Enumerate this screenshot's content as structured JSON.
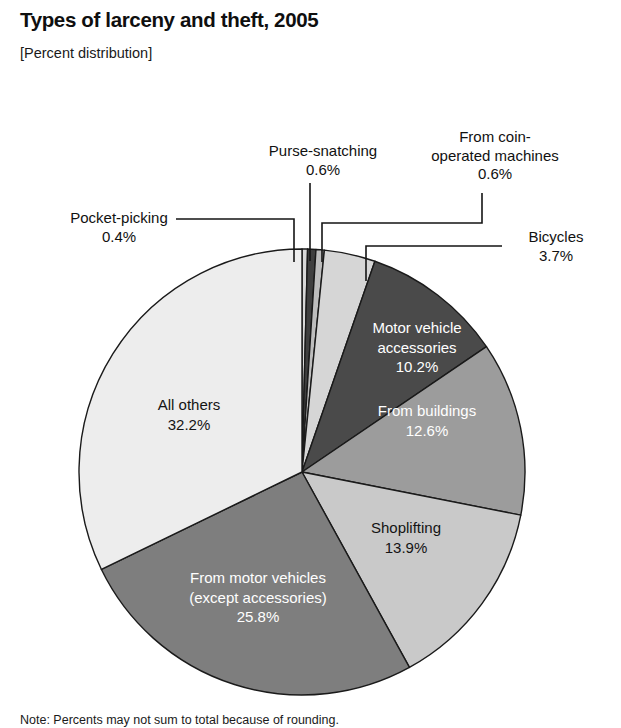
{
  "header": {
    "title": "Types of larceny and theft, 2005",
    "subtitle": "[Percent distribution]"
  },
  "note": {
    "text": "Note: Percents may not sum to total because of rounding."
  },
  "callouts": {
    "purse_snatching": {
      "name": "Purse-snatching",
      "value": "0.6%"
    },
    "coin_operated": {
      "name": "From coin-\noperated machines",
      "line1": "From coin-",
      "line2": "operated machines",
      "value": "0.6%"
    },
    "pocket_picking": {
      "name": "Pocket-picking",
      "value": "0.4%"
    },
    "bicycles": {
      "name": "Bicycles",
      "value": "3.7%"
    }
  },
  "slice_labels": {
    "motor_vehicle_accessories": {
      "line1": "Motor vehicle",
      "line2": "accessories",
      "value": "10.2%"
    },
    "from_buildings": {
      "line1": "From buildings",
      "value": "12.6%"
    },
    "shoplifting": {
      "line1": "Shoplifting",
      "value": "13.9%"
    },
    "from_motor_vehicles": {
      "line1": "From motor vehicles",
      "line2": "(except accessories)",
      "value": "25.8%"
    },
    "all_others": {
      "line1": "All others",
      "value": "32.2%"
    }
  },
  "chart_data": {
    "type": "pie",
    "title": "Types of larceny and theft, 2005",
    "subtitle": "[Percent distribution]",
    "unit": "percent",
    "total": 100.0,
    "legend_position": "labels-on-slices-and-callouts",
    "start_angle_deg": -90,
    "direction": "clockwise",
    "center": {
      "x": 302,
      "y": 472
    },
    "radius": 223,
    "categories": [
      "Pocket-picking",
      "Purse-snatching",
      "From coin-operated machines",
      "Bicycles",
      "Motor vehicle accessories",
      "From buildings",
      "Shoplifting",
      "From motor vehicles (except accessories)",
      "All others"
    ],
    "values": [
      0.4,
      0.6,
      0.6,
      3.7,
      10.2,
      12.6,
      13.9,
      25.8,
      32.2
    ],
    "labels": [
      "0.4%",
      "0.6%",
      "0.6%",
      "3.7%",
      "10.2%",
      "12.6%",
      "13.9%",
      "25.8%",
      "32.2%"
    ],
    "colors": [
      "#d8d8d8",
      "#3f3f3f",
      "#bdbdbd",
      "#d6d6d6",
      "#4a4a4a",
      "#9c9c9c",
      "#c9c9c9",
      "#7e7e7e",
      "#ededed"
    ],
    "slices": [
      {
        "name": "Pocket-picking",
        "value": 0.4,
        "label": "0.4%",
        "color": "#d8d8d8",
        "label_placement": "callout"
      },
      {
        "name": "Purse-snatching",
        "value": 0.6,
        "label": "0.6%",
        "color": "#3f3f3f",
        "label_placement": "callout"
      },
      {
        "name": "From coin-operated machines",
        "value": 0.6,
        "label": "0.6%",
        "color": "#bdbdbd",
        "label_placement": "callout"
      },
      {
        "name": "Bicycles",
        "value": 3.7,
        "label": "3.7%",
        "color": "#d6d6d6",
        "label_placement": "callout"
      },
      {
        "name": "Motor vehicle accessories",
        "value": 10.2,
        "label": "10.2%",
        "color": "#4a4a4a",
        "label_placement": "inside",
        "text_color": "#ffffff"
      },
      {
        "name": "From buildings",
        "value": 12.6,
        "label": "12.6%",
        "color": "#9c9c9c",
        "label_placement": "inside",
        "text_color": "#ffffff"
      },
      {
        "name": "Shoplifting",
        "value": 13.9,
        "label": "13.9%",
        "color": "#c9c9c9",
        "label_placement": "inside",
        "text_color": "#141414"
      },
      {
        "name": "From motor vehicles (except accessories)",
        "value": 25.8,
        "label": "25.8%",
        "color": "#7e7e7e",
        "label_placement": "inside",
        "text_color": "#ffffff"
      },
      {
        "name": "All others",
        "value": 32.2,
        "label": "32.2%",
        "color": "#ededed",
        "label_placement": "inside",
        "text_color": "#141414"
      }
    ]
  }
}
